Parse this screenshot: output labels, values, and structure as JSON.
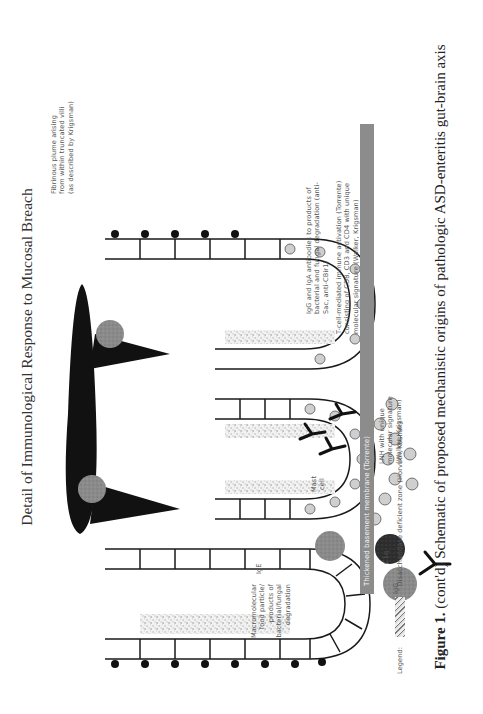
{
  "figure": {
    "title": "Detail of Immunological Response to Mucosal Breach",
    "caption_label": "Figure 1.",
    "caption_text": "(cont'd) Schematic of proposed mechanistic origins of pathologic ASD-enteritis gut-brain axis",
    "orientation": "rotated 90° counter-clockwise"
  },
  "annotations": {
    "fibrinous_plume": [
      "Fibrinous plume arising",
      "from within truncated villi",
      "(as described by Krigsman)"
    ],
    "igg_iga": [
      "IgG and IgA antibodies to products of",
      "bacterial and fungal degradation (anti-",
      "Sac, anti-CBir1)"
    ],
    "t_cell": [
      "T-cell-mediated immune activation (Torrente)",
      "consisting of CD8, CD3 and CD4 with unique",
      "molecular signature (Walker, Krigsman)"
    ],
    "basement_membrane": "Thickened basement membrane (Torrente)",
    "lnh": [
      "LNH with unique",
      "molecular signature",
      "(Walker, Krigsman)"
    ],
    "mast_cell": [
      "Mast",
      "cell"
    ],
    "ige": "IgE",
    "macromolecular": [
      "Macromolecular",
      "food particle/",
      "products of",
      "bacterial/fungal",
      "degradation"
    ],
    "c1q": "C1q",
    "igg": "IgG"
  },
  "legend": {
    "label": "Legend:",
    "items": [
      {
        "symbol": "stippled-zone",
        "text": [
          "Disaccharidase deficient zone",
          "(Horvath, Kushak)"
        ]
      }
    ]
  },
  "colors": {
    "ink": "#1a1a1a",
    "basement_membrane": "#8c8c8c",
    "t_cell_fill": "#cfcfcf",
    "particle_fill": "#8a8a8a",
    "mast_cell_fill": "#333333"
  }
}
